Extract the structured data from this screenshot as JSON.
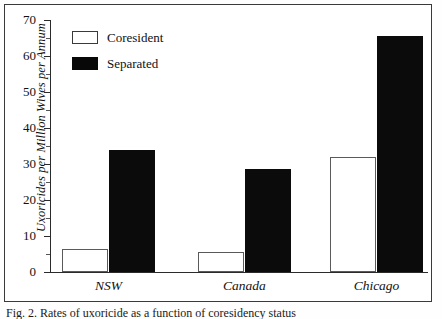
{
  "figure": {
    "caption": "Fig. 2. Rates of uxoricide as a function of coresidency status"
  },
  "chart_data": {
    "type": "bar",
    "title": "",
    "xlabel": "",
    "ylabel": "Uxoricides per Million Wives per Annum",
    "categories": [
      "NSW",
      "Canada",
      "Chicago"
    ],
    "series": [
      {
        "name": "Coresident",
        "color": "#ffffff",
        "values": [
          6.5,
          5.6,
          32.0
        ]
      },
      {
        "name": "Separated",
        "color": "#080808",
        "values": [
          34.0,
          28.5,
          65.5
        ]
      }
    ],
    "ylim": [
      0,
      70
    ],
    "yticks": [
      0,
      10,
      20,
      30,
      40,
      50,
      60,
      70
    ],
    "ytick_labels": [
      "0",
      "10",
      "20",
      "30",
      "40",
      "50",
      "60",
      "70"
    ],
    "yminor_ticks": [
      5,
      15,
      25,
      35,
      45,
      55,
      65
    ],
    "grid": false,
    "legend_position": "upper-left",
    "legend": [
      {
        "label": "Coresident",
        "swatch": "white-box"
      },
      {
        "label": "Separated",
        "swatch": "black-box"
      }
    ]
  }
}
